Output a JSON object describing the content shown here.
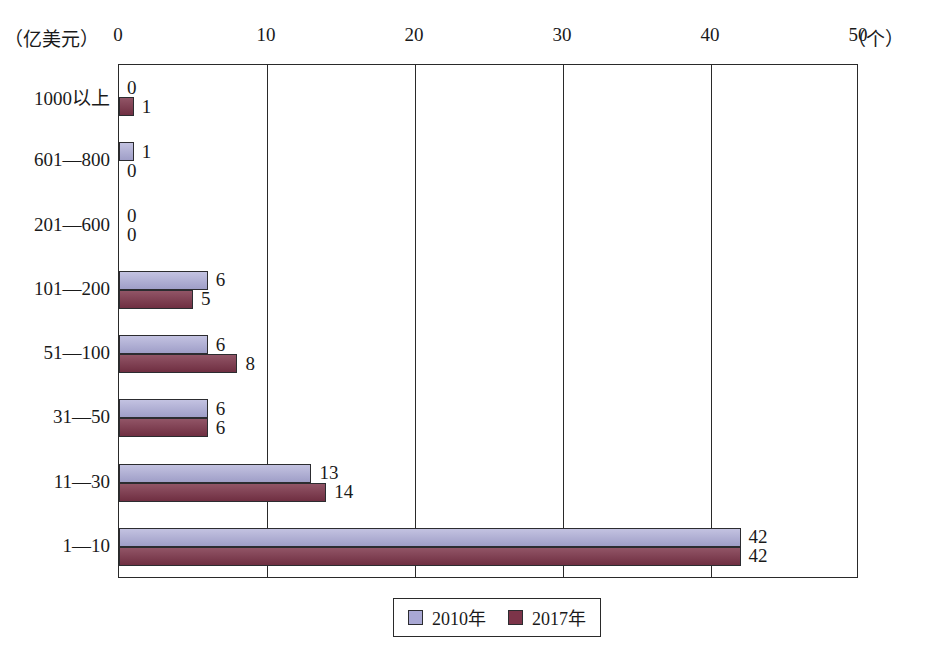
{
  "chart_data": {
    "type": "bar",
    "orientation": "horizontal",
    "title": "",
    "xlabel": "（个）",
    "ylabel": "（亿美元）",
    "xlim": [
      0,
      50
    ],
    "xticks": [
      0,
      10,
      20,
      30,
      40,
      50
    ],
    "xtick_labels": [
      "0",
      "10",
      "20",
      "30",
      "40",
      "50"
    ],
    "grid": true,
    "grid_axis": "x",
    "legend_position": "bottom",
    "categories": [
      "1000以上",
      "601—800",
      "201—600",
      "101—200",
      "51—100",
      "31—50",
      "11—30",
      "1—10"
    ],
    "series": [
      {
        "name": "2010年",
        "color": "#a9a8d4",
        "values": [
          0,
          1,
          0,
          6,
          6,
          6,
          13,
          42
        ]
      },
      {
        "name": "2017年",
        "color": "#7c3449",
        "values": [
          1,
          0,
          0,
          5,
          8,
          6,
          14,
          42
        ]
      }
    ]
  },
  "axis": {
    "unit_y": "（亿美元）",
    "unit_x": "（个）"
  },
  "legend": {
    "items": [
      {
        "label": "2010年",
        "color": "#a9a8d4"
      },
      {
        "label": "2017年",
        "color": "#7c3449"
      }
    ]
  },
  "colors": {
    "series_2010": "#a9a8d4",
    "series_2017": "#7c3449",
    "axis": "#2a2a2a",
    "background": "#ffffff"
  }
}
